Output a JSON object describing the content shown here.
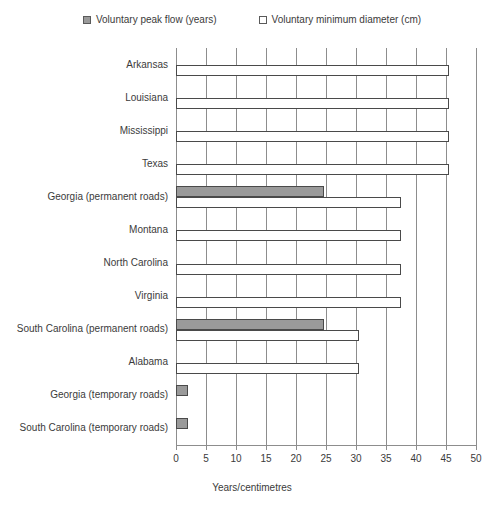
{
  "chart_data": {
    "type": "bar",
    "orientation": "horizontal",
    "title": "",
    "xlabel": "Years/centimetres",
    "ylabel": "",
    "xlim": [
      0,
      50
    ],
    "xticks": [
      0,
      5,
      10,
      15,
      20,
      25,
      30,
      35,
      40,
      45,
      50
    ],
    "grid": true,
    "grid_axis": "x",
    "legend_position": "top",
    "categories": [
      "Arkansas",
      "Louisiana",
      "Mississippi",
      "Texas",
      "Georgia (permanent roads)",
      "Montana",
      "North Carolina",
      "Virginia",
      "South Carolina (permanent roads)",
      "Alabama",
      "Georgia (temporary roads)",
      "South Carolina (temporary roads)"
    ],
    "series": [
      {
        "name": "Voluntary peak flow (years)",
        "color": "#9a9a9a",
        "values": [
          0,
          0,
          0,
          0,
          24.7,
          0,
          0,
          0,
          24.7,
          0,
          2,
          2
        ]
      },
      {
        "name": "Voluntary minimum diameter (cm)",
        "color": "#ffffff",
        "values": [
          45.5,
          45.5,
          45.5,
          45.5,
          37.5,
          37.5,
          37.5,
          37.5,
          30.5,
          30.5,
          0,
          0
        ]
      }
    ]
  },
  "legend": {
    "entries": [
      {
        "label": "Voluntary peak flow (years)"
      },
      {
        "label": "Voluntary minimum diameter (cm)"
      }
    ]
  },
  "axis": {
    "x_title": "Years/centimetres",
    "tick_labels": [
      "0",
      "5",
      "10",
      "15",
      "20",
      "25",
      "30",
      "35",
      "40",
      "45",
      "50"
    ]
  },
  "colors": {
    "peak_flow_fill": "#9a9a9a",
    "diameter_fill": "#ffffff",
    "bar_border": "#4a4a4a",
    "grid": "#8d8d8d",
    "text": "#3b3b3b"
  }
}
